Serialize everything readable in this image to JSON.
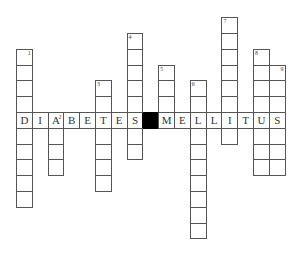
{
  "puzzle": {
    "type": "crossword",
    "horizontal_word": "DIABETES MELLITUS",
    "row_letters": [
      "D",
      "I",
      "A",
      "B",
      "E",
      "T",
      "E",
      "S",
      "",
      "M",
      "E",
      "L",
      "L",
      "I",
      "T",
      "U",
      "S"
    ],
    "black_cell_index": 8,
    "clues": [
      {
        "number": "1",
        "col": 0,
        "above": 4,
        "below": 5
      },
      {
        "number": "2",
        "col": 2,
        "above": 0,
        "below": 3
      },
      {
        "number": "3",
        "col": 5,
        "above": 2,
        "below": 4
      },
      {
        "number": "4",
        "col": 7,
        "above": 5,
        "below": 2
      },
      {
        "number": "5",
        "col": 9,
        "above": 3,
        "below": 0
      },
      {
        "number": "6",
        "col": 11,
        "above": 2,
        "below": 7
      },
      {
        "number": "7",
        "col": 13,
        "above": 6,
        "below": 1
      },
      {
        "number": "8",
        "col": 15,
        "above": 4,
        "below": 3
      },
      {
        "number": "9",
        "col": 16,
        "above": 3,
        "below": 3
      }
    ]
  },
  "layout": {
    "origin_x": 16,
    "row_y": 112,
    "cell": 15.8
  }
}
